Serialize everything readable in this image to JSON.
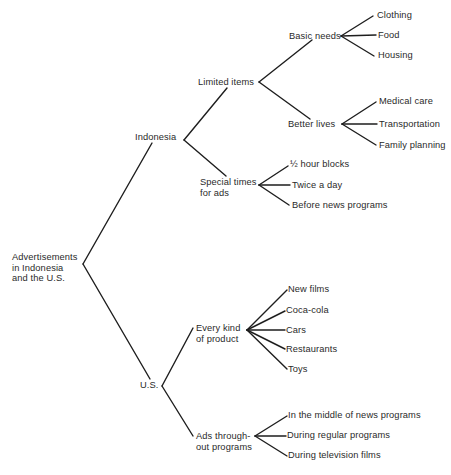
{
  "diagram": {
    "type": "tree",
    "root": {
      "label": "Advertisements\nin Indonesia\nand the U.S.",
      "children": [
        {
          "label": "Indonesia",
          "children": [
            {
              "label": "Limited items",
              "children": [
                {
                  "label": "Basic needs",
                  "children": [
                    {
                      "label": "Clothing"
                    },
                    {
                      "label": "Food"
                    },
                    {
                      "label": "Housing"
                    }
                  ]
                },
                {
                  "label": "Better lives",
                  "children": [
                    {
                      "label": "Medical care"
                    },
                    {
                      "label": "Transportation"
                    },
                    {
                      "label": "Family planning"
                    }
                  ]
                }
              ]
            },
            {
              "label": "Special times\nfor ads",
              "children": [
                {
                  "label": "½ hour blocks"
                },
                {
                  "label": "Twice a day"
                },
                {
                  "label": "Before news programs"
                }
              ]
            }
          ]
        },
        {
          "label": "U.S.",
          "children": [
            {
              "label": "Every kind\nof product",
              "children": [
                {
                  "label": "New films"
                },
                {
                  "label": "Coca-cola"
                },
                {
                  "label": "Cars"
                },
                {
                  "label": "Restaurants"
                },
                {
                  "label": "Toys"
                }
              ]
            },
            {
              "label": "Ads through-\nout programs",
              "children": [
                {
                  "label": "In the middle of news programs"
                },
                {
                  "label": "During regular programs"
                },
                {
                  "label": "During television films"
                }
              ]
            }
          ]
        }
      ]
    }
  },
  "colors": {
    "background": "#ffffff",
    "text": "#2a2a2a",
    "lines": "#1e1e1e"
  }
}
